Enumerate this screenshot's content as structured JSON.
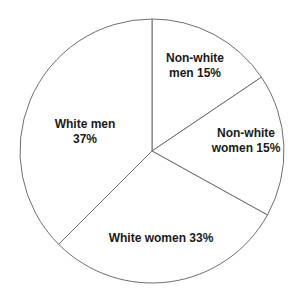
{
  "chart_data": {
    "type": "pie",
    "title": "",
    "categories": [
      "Non-white men",
      "Non-white women",
      "White women",
      "White men"
    ],
    "values": [
      15,
      15,
      33,
      37
    ],
    "unit": "%",
    "start_angle_deg": 0,
    "direction": "clockwise",
    "boundaries_deg": [
      0,
      56,
      119,
      225,
      360
    ],
    "colors": [
      "#ffffff",
      "#ffffff",
      "#ffffff",
      "#ffffff"
    ],
    "stroke_color": "#6e6e6e",
    "legend": "none",
    "labels": [
      {
        "lines": [
          "Non-white",
          "men 15%"
        ],
        "x": 195,
        "y": [
          62,
          77
        ],
        "anchor": "middle"
      },
      {
        "lines": [
          "Non-white",
          "women 15%"
        ],
        "x": 246,
        "y": [
          137,
          152
        ],
        "anchor": "middle"
      },
      {
        "lines": [
          "White women 33%"
        ],
        "x": 161,
        "y": [
          242
        ],
        "anchor": "middle"
      },
      {
        "lines": [
          "White men",
          "37%"
        ],
        "x": 85,
        "y": [
          128,
          143
        ],
        "anchor": "middle"
      }
    ]
  },
  "geometry": {
    "cx": 152,
    "cy": 151,
    "r": 132
  }
}
